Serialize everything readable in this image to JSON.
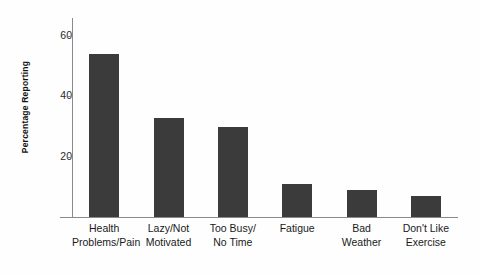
{
  "chart_data": {
    "type": "bar",
    "title": "",
    "xlabel": "",
    "ylabel": "Percentage Reporting",
    "categories": [
      "Health Problems/Pain",
      "Lazy/Not Motivated",
      "Too Busy/ No Time",
      "Fatigue",
      "Bad Weather",
      "Don't Like Exercise"
    ],
    "category_lines": [
      [
        "Health",
        "Problems/Pain"
      ],
      [
        "Lazy/Not",
        "Motivated"
      ],
      [
        "Too Busy/",
        "No Time"
      ],
      [
        "Fatigue"
      ],
      [
        "Bad",
        "Weather"
      ],
      [
        "Don't Like",
        "Exercise"
      ]
    ],
    "values": [
      54,
      33,
      30,
      11,
      9,
      7
    ],
    "ylim": [
      0,
      66
    ],
    "yticks": [
      20,
      40,
      60
    ],
    "ytick_labels": [
      "20",
      "40",
      "60"
    ],
    "grid": false,
    "legend": null,
    "bar_color": "#3b3b3b",
    "axis_color": "#8a8a8a",
    "background_color": "#fefefe"
  }
}
